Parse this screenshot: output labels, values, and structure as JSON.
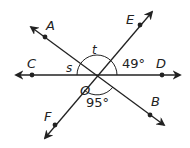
{
  "diagram": {
    "center_label": "O",
    "points": {
      "A": "A",
      "B": "B",
      "C": "C",
      "D": "D",
      "E": "E",
      "F": "F"
    },
    "angles": {
      "s": "s",
      "t": "t",
      "eod": "49°",
      "fob": "95°"
    },
    "colors": {
      "line": "#222222",
      "background": "#ffffff"
    }
  }
}
